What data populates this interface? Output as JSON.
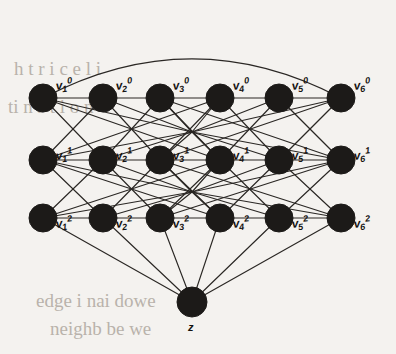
{
  "figure": {
    "background_color": "#f4f2ef",
    "node_color": "#1c1a18",
    "edge_color": "#2a2724",
    "width": 396,
    "height": 354
  },
  "layout": {
    "node_radius": 14,
    "sink_radius": 15,
    "columns_x": [
      43,
      103,
      160,
      220,
      279,
      341
    ],
    "rows_y": [
      98,
      160,
      218
    ],
    "sink": {
      "x": 192,
      "y": 302
    },
    "hub_points": [
      {
        "x": 192,
        "y": 132
      },
      {
        "x": 192,
        "y": 192
      }
    ],
    "arc_peak_y": 28
  },
  "nodes": {
    "layer_0": [
      {
        "id": "v1-0",
        "base": "v",
        "sub": "1",
        "sup": "0",
        "col": 0,
        "row": 0
      },
      {
        "id": "v2-0",
        "base": "v",
        "sub": "2",
        "sup": "0",
        "col": 1,
        "row": 0
      },
      {
        "id": "v3-0",
        "base": "v",
        "sub": "3",
        "sup": "0",
        "col": 2,
        "row": 0
      },
      {
        "id": "v4-0",
        "base": "v",
        "sub": "4",
        "sup": "0",
        "col": 3,
        "row": 0
      },
      {
        "id": "v5-0",
        "base": "v",
        "sub": "5",
        "sup": "0",
        "col": 4,
        "row": 0
      },
      {
        "id": "v6-0",
        "base": "v",
        "sub": "6",
        "sup": "0",
        "col": 5,
        "row": 0
      }
    ],
    "layer_1": [
      {
        "id": "v1-1",
        "base": "v",
        "sub": "1",
        "sup": "1",
        "col": 0,
        "row": 1
      },
      {
        "id": "v2-1",
        "base": "v",
        "sub": "2",
        "sup": "1",
        "col": 1,
        "row": 1
      },
      {
        "id": "v3-1",
        "base": "v",
        "sub": "3",
        "sup": "1",
        "col": 2,
        "row": 1
      },
      {
        "id": "v4-1",
        "base": "v",
        "sub": "4",
        "sup": "1",
        "col": 3,
        "row": 1
      },
      {
        "id": "v5-1",
        "base": "v",
        "sub": "5",
        "sup": "1",
        "col": 4,
        "row": 1
      },
      {
        "id": "v6-1",
        "base": "v",
        "sub": "6",
        "sup": "1",
        "col": 5,
        "row": 1
      }
    ],
    "layer_2": [
      {
        "id": "v1-2",
        "base": "v",
        "sub": "1",
        "sup": "2",
        "col": 0,
        "row": 2
      },
      {
        "id": "v2-2",
        "base": "v",
        "sub": "2",
        "sup": "2",
        "col": 1,
        "row": 2
      },
      {
        "id": "v3-2",
        "base": "v",
        "sub": "3",
        "sup": "2",
        "col": 2,
        "row": 2
      },
      {
        "id": "v4-2",
        "base": "v",
        "sub": "4",
        "sup": "2",
        "col": 3,
        "row": 2
      },
      {
        "id": "v5-2",
        "base": "v",
        "sub": "5",
        "sup": "2",
        "col": 4,
        "row": 2
      },
      {
        "id": "v6-2",
        "base": "v",
        "sub": "6",
        "sup": "2",
        "col": 5,
        "row": 2
      }
    ],
    "sink": {
      "id": "z",
      "base": "z",
      "sub": "",
      "sup": ""
    }
  },
  "edges": {
    "top_row_chain": [
      [
        0,
        0,
        1,
        0
      ],
      [
        1,
        0,
        2,
        0
      ],
      [
        2,
        0,
        3,
        0
      ],
      [
        3,
        0,
        4,
        0
      ],
      [
        4,
        0,
        5,
        0
      ]
    ],
    "top_arc": {
      "from": "v1-0",
      "to": "v6-0"
    },
    "layer0_to_layer1": [
      [
        0,
        0,
        1,
        1
      ],
      [
        1,
        0,
        0,
        1
      ],
      [
        1,
        0,
        2,
        1
      ],
      [
        2,
        0,
        1,
        1
      ],
      [
        2,
        0,
        3,
        1
      ],
      [
        3,
        0,
        2,
        1
      ],
      [
        3,
        0,
        4,
        1
      ],
      [
        4,
        0,
        3,
        1
      ],
      [
        4,
        0,
        5,
        1
      ],
      [
        5,
        0,
        4,
        1
      ],
      [
        0,
        0,
        3,
        1
      ],
      [
        5,
        0,
        2,
        1
      ],
      [
        0,
        1,
        3,
        0
      ],
      [
        5,
        1,
        2,
        0
      ]
    ],
    "layer1_to_layer2": [
      [
        0,
        1,
        1,
        2
      ],
      [
        1,
        1,
        0,
        2
      ],
      [
        1,
        1,
        2,
        2
      ],
      [
        2,
        1,
        1,
        2
      ],
      [
        2,
        1,
        3,
        2
      ],
      [
        3,
        1,
        2,
        2
      ],
      [
        3,
        1,
        4,
        2
      ],
      [
        4,
        1,
        3,
        2
      ],
      [
        4,
        1,
        5,
        2
      ],
      [
        5,
        1,
        4,
        2
      ],
      [
        0,
        1,
        3,
        2
      ],
      [
        5,
        1,
        2,
        2
      ],
      [
        0,
        2,
        3,
        1
      ],
      [
        5,
        2,
        2,
        1
      ]
    ],
    "layer2_to_sink": [
      {
        "from": "v1-2"
      },
      {
        "from": "v2-2"
      },
      {
        "from": "v3-2"
      },
      {
        "from": "v4-2"
      },
      {
        "from": "v5-2"
      },
      {
        "from": "v6-2"
      }
    ],
    "middle_row_chain": [
      [
        0,
        1,
        5,
        1
      ]
    ],
    "lower_row_chain": [
      [
        0,
        2,
        5,
        2
      ]
    ]
  },
  "background_text": {
    "line_top_1": "h t r i c e l i",
    "line_top_2": "ti n s t i o n",
    "line_bottom_1": "edge   i nai dowe",
    "line_bottom_2": "neighb   be we"
  }
}
